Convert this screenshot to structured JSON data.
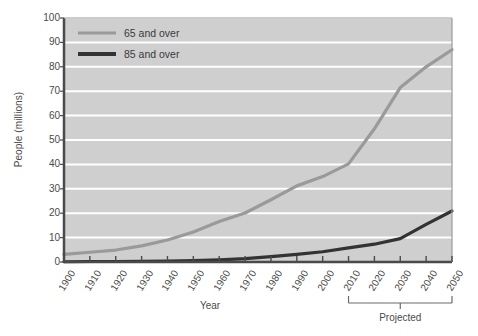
{
  "chart_data": {
    "type": "line",
    "title": "",
    "xlabel": "Year",
    "ylabel": "People (millions)",
    "xlim": [
      1900,
      2050
    ],
    "ylim": [
      0,
      100
    ],
    "grid": true,
    "legend_position": "top-left",
    "x": [
      1900,
      1910,
      1920,
      1930,
      1940,
      1950,
      1960,
      1970,
      1980,
      1990,
      2000,
      2010,
      2020,
      2030,
      2040,
      2050
    ],
    "xticklabels": [
      "1900",
      "1910",
      "1920",
      "1930",
      "1940",
      "1950",
      "1960",
      "1970",
      "1980",
      "1990",
      "2000",
      "2010",
      "2020",
      "2030",
      "2040",
      "2050"
    ],
    "yticks": [
      0,
      10,
      20,
      30,
      40,
      50,
      60,
      70,
      80,
      90,
      100
    ],
    "yticklabels": [
      "0",
      "10",
      "20",
      "30",
      "40",
      "50",
      "60",
      "70",
      "80",
      "90",
      "100"
    ],
    "series": [
      {
        "name": "65 and over",
        "color": "#9a9a9a",
        "values": [
          3.1,
          4.0,
          4.9,
          6.6,
          9.0,
          12.3,
          16.6,
          20.1,
          25.5,
          31.2,
          35.0,
          40.2,
          54.6,
          71.5,
          80.0,
          87.0
        ]
      },
      {
        "name": "85 and over",
        "color": "#333333",
        "values": [
          0.1,
          0.2,
          0.2,
          0.3,
          0.4,
          0.6,
          0.9,
          1.4,
          2.2,
          3.1,
          4.2,
          5.8,
          7.3,
          9.6,
          15.4,
          20.9
        ]
      }
    ],
    "annotations": [
      {
        "name": "projected-bracket",
        "label": "Projected",
        "from_x": 2010,
        "to_x": 2050
      }
    ]
  },
  "legend": {
    "items": [
      {
        "label": "65 and over",
        "color": "#9a9a9a"
      },
      {
        "label": "85 and over",
        "color": "#333333"
      }
    ]
  },
  "axes": {
    "x_title": "Year",
    "y_title": "People (millions)"
  },
  "annotation": {
    "projected_label": "Projected"
  },
  "ticks": {
    "y": [
      "100",
      "90",
      "80",
      "70",
      "60",
      "50",
      "40",
      "30",
      "20",
      "10",
      "0"
    ],
    "x": [
      "1900",
      "1910",
      "1920",
      "1930",
      "1940",
      "1950",
      "1960",
      "1970",
      "1980",
      "1990",
      "2000",
      "2010",
      "2020",
      "2030",
      "2040",
      "2050"
    ]
  },
  "colors": {
    "plot_background": "#cfcfcf",
    "gridline": "#ffffff",
    "axis": "#555555",
    "series_65": "#9a9a9a",
    "series_85": "#333333",
    "text": "#4a4a4a"
  }
}
